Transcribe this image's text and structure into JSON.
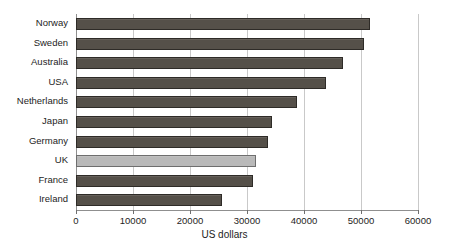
{
  "chart_data": {
    "type": "bar",
    "orientation": "horizontal",
    "title": "",
    "xlabel": "US dollars",
    "ylabel": "",
    "xlim": [
      0,
      60000
    ],
    "xticks": [
      0,
      10000,
      20000,
      30000,
      40000,
      50000,
      60000
    ],
    "xtick_labels": [
      "0",
      "10000",
      "20000",
      "30000",
      "40000",
      "50000",
      "60000"
    ],
    "grid": true,
    "legend": null,
    "categories": [
      "Norway",
      "Sweden",
      "Australia",
      "USA",
      "Netherlands",
      "Japan",
      "Germany",
      "UK",
      "France",
      "Ireland"
    ],
    "values": [
      51500,
      50500,
      46800,
      43800,
      38800,
      34400,
      33700,
      31600,
      31100,
      25600
    ],
    "highlighted_category": "UK",
    "colors": {
      "bar": "#555049",
      "bar_border": "#2e2b27",
      "bar_highlight": "#b9b9b9",
      "bar_highlight_border": "#6e6e6e",
      "gridline": "#c9c9c9",
      "axis": "#8f8f8f",
      "text": "#1d1d1d",
      "background": "#ffffff"
    }
  }
}
